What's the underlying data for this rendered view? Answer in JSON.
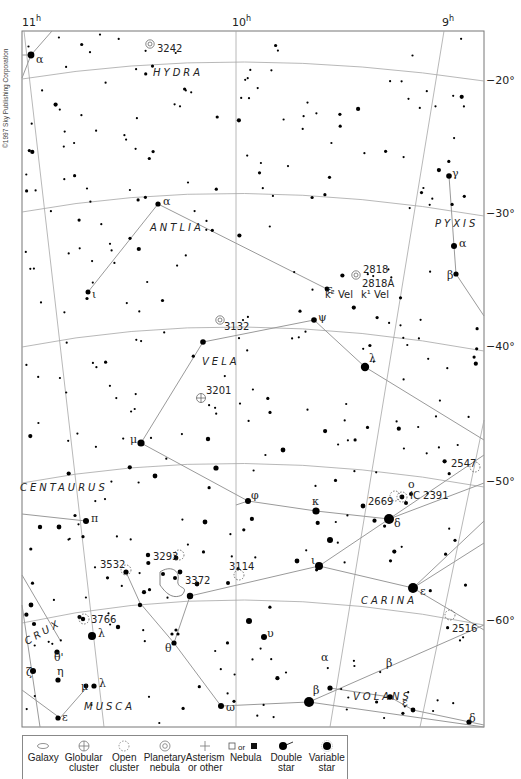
{
  "copyright": "©1997 Sky Publishing Corporation",
  "axes": {
    "ra_labels": [
      {
        "text": "11",
        "sup": "h",
        "x": 22,
        "y": 26
      },
      {
        "text": "10",
        "sup": "h",
        "x": 232,
        "y": 26
      },
      {
        "text": "9",
        "sup": "h",
        "x": 442,
        "y": 26
      }
    ],
    "dec_labels": [
      {
        "text": "−20°",
        "x": 486,
        "y": 84
      },
      {
        "text": "−30°",
        "x": 486,
        "y": 217
      },
      {
        "text": "−40°",
        "x": 486,
        "y": 350
      },
      {
        "text": "−50°",
        "x": 486,
        "y": 485
      },
      {
        "text": "−60°",
        "x": 486,
        "y": 624
      }
    ]
  },
  "constellations": [
    {
      "name": "HYDRA",
      "x": 153,
      "y": 76
    },
    {
      "name": "ANTLIA",
      "x": 150,
      "y": 231
    },
    {
      "name": "PYXIS",
      "x": 435,
      "y": 227
    },
    {
      "name": "VELA",
      "x": 202,
      "y": 365
    },
    {
      "name": "CENTAURUS",
      "x": 20,
      "y": 491
    },
    {
      "name": "CARINA",
      "x": 361,
      "y": 604
    },
    {
      "name": "CRUX",
      "x": 27,
      "y": 645,
      "rotate": -30
    },
    {
      "name": "MUSCA",
      "x": 84,
      "y": 710
    },
    {
      "name": "VOLANS",
      "x": 353,
      "y": 700
    }
  ],
  "objects": [
    {
      "id": "3242",
      "type": "planetary-nebula",
      "x": 150,
      "y": 44,
      "lx": 157,
      "ly": 52
    },
    {
      "id": "2818",
      "type": "planetary-nebula",
      "x": 356,
      "y": 275,
      "lx": 363,
      "ly": 273
    },
    {
      "id": "2818A",
      "type": "open-cluster-label",
      "x": 0,
      "y": 0,
      "lx": 362,
      "ly": 287
    },
    {
      "id": "3132",
      "type": "planetary-nebula",
      "x": 220,
      "y": 320,
      "lx": 224,
      "ly": 330
    },
    {
      "id": "3201",
      "type": "globular-cluster",
      "x": 201,
      "y": 398,
      "lx": 206,
      "ly": 394
    },
    {
      "id": "2547",
      "type": "open-cluster",
      "x": 475,
      "y": 467,
      "lx": 451,
      "ly": 467
    },
    {
      "id": "2669",
      "type": "open-cluster",
      "x": 395,
      "y": 496,
      "lx": 368,
      "ly": 505
    },
    {
      "id": "IC 2391",
      "type": "open-cluster",
      "x": 402,
      "y": 497,
      "lx": 410,
      "ly": 499
    },
    {
      "id": "3293",
      "type": "open-cluster",
      "x": 179,
      "y": 555,
      "lx": 153,
      "ly": 560
    },
    {
      "id": "3532",
      "type": "open-cluster",
      "x": 126,
      "y": 570,
      "lx": 100,
      "ly": 568
    },
    {
      "id": "3114",
      "type": "open-cluster",
      "x": 239,
      "y": 575,
      "lx": 229,
      "ly": 570
    },
    {
      "id": "3372",
      "type": "nebula",
      "x": 165,
      "y": 580,
      "lx": 185,
      "ly": 584
    },
    {
      "id": "3766",
      "type": "open-cluster",
      "x": 84,
      "y": 619,
      "lx": 91,
      "ly": 623
    },
    {
      "id": "2516",
      "type": "open-cluster",
      "x": 450,
      "y": 615,
      "lx": 452,
      "ly": 632
    }
  ],
  "star_labels": [
    {
      "t": "α",
      "x": 36,
      "y": 63
    },
    {
      "t": "α",
      "x": 163,
      "y": 205
    },
    {
      "t": "ι",
      "x": 92,
      "y": 298
    },
    {
      "t": "ε",
      "x": 327,
      "y": 293
    },
    {
      "t": "k² Vel",
      "x": 325,
      "y": 298,
      "small": true
    },
    {
      "t": "k¹ Vel",
      "x": 361,
      "y": 298,
      "small": true
    },
    {
      "t": "ψ",
      "x": 318,
      "y": 321
    },
    {
      "t": "γ",
      "x": 452,
      "y": 177
    },
    {
      "t": "α",
      "x": 459,
      "y": 247
    },
    {
      "t": "β",
      "x": 447,
      "y": 279
    },
    {
      "t": "λ",
      "x": 369,
      "y": 362
    },
    {
      "t": "μ",
      "x": 130,
      "y": 443
    },
    {
      "t": "φ",
      "x": 251,
      "y": 499
    },
    {
      "t": "κ",
      "x": 312,
      "y": 505
    },
    {
      "t": "δ",
      "x": 394,
      "y": 527
    },
    {
      "t": "ο",
      "x": 408,
      "y": 488
    },
    {
      "t": "ι",
      "x": 311,
      "y": 564
    },
    {
      "t": "π",
      "x": 91,
      "y": 522
    },
    {
      "t": "ε",
      "x": 420,
      "y": 595
    },
    {
      "t": "θ",
      "x": 165,
      "y": 652
    },
    {
      "t": "λ",
      "x": 98,
      "y": 637
    },
    {
      "t": "ζ",
      "x": 26,
      "y": 676
    },
    {
      "t": "θ'",
      "x": 54,
      "y": 661
    },
    {
      "t": "η",
      "x": 57,
      "y": 675
    },
    {
      "t": "μ",
      "x": 81,
      "y": 690
    },
    {
      "t": "λ",
      "x": 99,
      "y": 687
    },
    {
      "t": "υ",
      "x": 267,
      "y": 637
    },
    {
      "t": "α",
      "x": 321,
      "y": 661
    },
    {
      "t": "β",
      "x": 386,
      "y": 667
    },
    {
      "t": "β",
      "x": 313,
      "y": 694
    },
    {
      "t": "ε",
      "x": 402,
      "y": 706
    },
    {
      "t": "ω",
      "x": 226,
      "y": 711
    },
    {
      "t": "ε",
      "x": 62,
      "y": 721
    },
    {
      "t": "δ",
      "x": 469,
      "y": 722
    }
  ],
  "legend": {
    "items": [
      {
        "label1": "Galaxy",
        "label2": "",
        "icon": "galaxy-icon"
      },
      {
        "label1": "Globular",
        "label2": "cluster",
        "icon": "globular-cluster-icon"
      },
      {
        "label1": "Open",
        "label2": "cluster",
        "icon": "open-cluster-icon"
      },
      {
        "label1": "Planetary",
        "label2": "nebula",
        "icon": "planetary-nebula-icon"
      },
      {
        "label1": "Asterism",
        "label2": "or other",
        "icon": "asterism-icon"
      },
      {
        "label1": "Nebula",
        "label2": "",
        "icon": "nebula-icon",
        "sym_text": "or"
      },
      {
        "label1": "Double",
        "label2": "star",
        "icon": "double-star-icon"
      },
      {
        "label1": "Variable",
        "label2": "star",
        "icon": "variable-star-icon"
      }
    ]
  },
  "colors": {
    "line": "#9a9a9a",
    "frame": "#777777",
    "star": "#000000",
    "text": "#222222"
  }
}
